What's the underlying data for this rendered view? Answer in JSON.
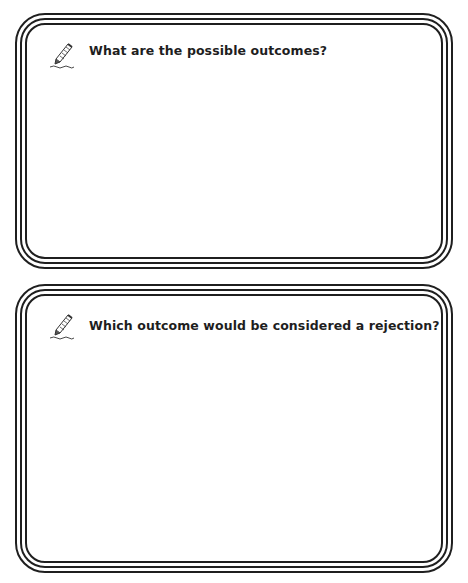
{
  "page": {
    "background": "#ffffff",
    "frame_color": "#1f1f1f"
  },
  "cards": [
    {
      "icon": "pencil-icon",
      "prompt": "What are the possible outcomes?",
      "answer": ""
    },
    {
      "icon": "pencil-icon",
      "prompt": "Which outcome would be considered a rejection?",
      "answer": ""
    }
  ]
}
